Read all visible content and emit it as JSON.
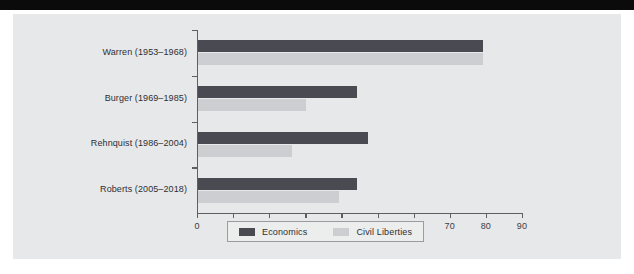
{
  "page": {
    "background_color": "#ffffff",
    "panel_color": "#e7e8ea",
    "top_band_color": "#0c0b0c"
  },
  "chart_data": {
    "type": "bar",
    "orientation": "horizontal",
    "title": "",
    "xlabel": "",
    "ylabel": "",
    "xlim": [
      0,
      90
    ],
    "xticks": [
      "0",
      "10",
      "20",
      "30",
      "40",
      "50",
      "60",
      "70",
      "80",
      "90"
    ],
    "grid": false,
    "legend_position": "bottom",
    "categories": [
      "Warren (1953–1968)",
      "Burger (1969–1985)",
      "Rehnquist (1986–2004)",
      "Roberts (2005–2018)"
    ],
    "series": [
      {
        "name": "Economics",
        "color": "#4a4a52",
        "values": [
          79,
          44,
          47,
          44
        ]
      },
      {
        "name": "Civil Liberties",
        "color": "#cdced1",
        "values": [
          79,
          30,
          26,
          39
        ]
      }
    ]
  },
  "legend": {
    "items": [
      {
        "label": "Economics",
        "color": "#4a4a52"
      },
      {
        "label": "Civil Liberties",
        "color": "#cdced1"
      }
    ]
  }
}
